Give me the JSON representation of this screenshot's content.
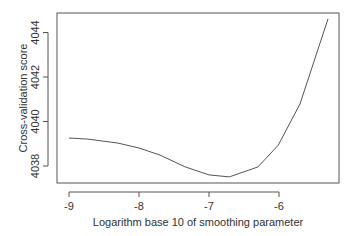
{
  "chart_data": {
    "type": "line",
    "title": "",
    "xlabel": "Logarithm base 10 of smoothing parameter",
    "ylabel": "Cross-validation score",
    "xlim": [
      -9.17,
      -5.14
    ],
    "ylim": [
      4037.2,
      4044.9
    ],
    "x_ticks": [
      -9,
      -8,
      -7,
      -6
    ],
    "x_tick_labels": [
      "-9",
      "-8",
      "-7",
      "-6"
    ],
    "y_ticks": [
      4038,
      4040,
      4042,
      4044
    ],
    "y_tick_labels": [
      "4038",
      "4040",
      "4042",
      "4044"
    ],
    "grid": false,
    "legend": null,
    "series": [
      {
        "name": "CV score",
        "color": "#555555",
        "x": [
          -9.0,
          -8.73,
          -8.3,
          -8.0,
          -7.7,
          -7.34,
          -7.0,
          -6.71,
          -6.3,
          -6.01,
          -5.7,
          -5.3
        ],
        "y": [
          4039.26,
          4039.21,
          4039.03,
          4038.81,
          4038.49,
          4037.96,
          4037.6,
          4037.51,
          4037.96,
          4038.94,
          4040.79,
          4044.61
        ]
      }
    ]
  }
}
